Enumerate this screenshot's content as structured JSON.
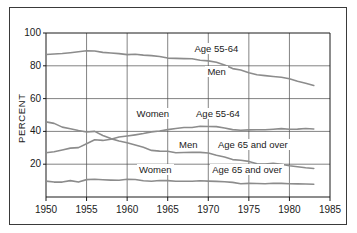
{
  "figure": {
    "background": "#ffffff",
    "frame_color": "#3a3a3a",
    "axis_color": "#1a1a1a",
    "grid_color": "#4d4d4d",
    "line_color": "#8c8c8c"
  },
  "axis": {
    "ylabel": "PERCENT",
    "yticks": [
      "20",
      "40",
      "60",
      "80",
      "100"
    ],
    "xticks": [
      "1950",
      "1955",
      "1960",
      "1965",
      "1970",
      "1975",
      "1980",
      "1985"
    ]
  },
  "annotations": [
    {
      "text": "Age 55-64",
      "name": "annotation-men-55-64-group"
    },
    {
      "text": "Men",
      "name": "annotation-men-55-64"
    },
    {
      "text": "Women",
      "name": "annotation-women-55-64"
    },
    {
      "text": "Age 55-64",
      "name": "annotation-women-55-64-group"
    },
    {
      "text": "Men",
      "name": "annotation-men-65-plus"
    },
    {
      "text": "Age 65 and over",
      "name": "annotation-men-65-plus-group"
    },
    {
      "text": "Women",
      "name": "annotation-women-65-plus"
    },
    {
      "text": "Age 65 and over",
      "name": "annotation-women-65-plus-group"
    }
  ],
  "chart_data": {
    "type": "line",
    "title": "",
    "xlabel": "",
    "ylabel": "PERCENT",
    "xlim": [
      1950,
      1985
    ],
    "ylim": [
      0,
      100
    ],
    "grid": true,
    "legend_position": "inline-annotations",
    "xticks": [
      1950,
      1955,
      1960,
      1965,
      1970,
      1975,
      1980,
      1985
    ],
    "yticks": [
      20,
      40,
      60,
      80,
      100
    ],
    "x": [
      1950,
      1951,
      1952,
      1953,
      1954,
      1955,
      1956,
      1957,
      1958,
      1959,
      1960,
      1961,
      1962,
      1963,
      1964,
      1965,
      1966,
      1967,
      1968,
      1969,
      1970,
      1971,
      1972,
      1973,
      1974,
      1975,
      1976,
      1977,
      1978,
      1979,
      1980,
      1981,
      1982,
      1983
    ],
    "series": [
      {
        "name": "Men Age 55-64",
        "label": "Men",
        "group": "Age 55-64",
        "values": [
          86.9,
          87.2,
          87.5,
          88.0,
          88.6,
          89.2,
          89.0,
          88.2,
          87.8,
          87.4,
          86.8,
          87.0,
          86.5,
          86.2,
          85.7,
          84.7,
          84.5,
          84.4,
          84.3,
          83.4,
          83.0,
          82.2,
          80.5,
          78.3,
          77.4,
          75.8,
          74.5,
          74.0,
          73.5,
          73.0,
          72.1,
          70.6,
          69.4,
          68.0
        ]
      },
      {
        "name": "Women Age 55-64",
        "label": "Women",
        "group": "Age 55-64",
        "values": [
          27.0,
          27.6,
          28.7,
          29.8,
          30.1,
          32.5,
          34.9,
          34.5,
          35.2,
          36.6,
          37.2,
          37.9,
          38.7,
          39.7,
          40.2,
          41.1,
          41.8,
          42.4,
          42.4,
          43.1,
          43.0,
          42.9,
          42.1,
          41.1,
          40.7,
          40.9,
          41.0,
          41.0,
          41.3,
          41.7,
          41.3,
          41.4,
          41.8,
          41.5
        ]
      },
      {
        "name": "Men Age 65 and over",
        "label": "Men",
        "group": "Age 65 and over",
        "values": [
          45.8,
          44.9,
          42.6,
          41.6,
          40.5,
          39.6,
          40.0,
          37.5,
          35.6,
          34.2,
          33.1,
          31.7,
          30.3,
          28.4,
          28.0,
          27.9,
          27.0,
          27.1,
          27.3,
          27.2,
          26.8,
          25.5,
          24.4,
          22.8,
          22.4,
          21.7,
          20.3,
          20.1,
          20.5,
          20.0,
          19.1,
          18.4,
          17.8,
          17.4
        ]
      },
      {
        "name": "Women Age 65 and over",
        "label": "Women",
        "group": "Age 65 and over",
        "values": [
          9.7,
          9.1,
          9.1,
          10.0,
          9.1,
          10.6,
          10.8,
          10.5,
          10.3,
          10.2,
          10.8,
          10.7,
          9.9,
          9.6,
          10.1,
          10.0,
          9.6,
          9.6,
          9.6,
          9.9,
          9.7,
          9.5,
          9.3,
          8.9,
          8.1,
          8.3,
          8.2,
          8.1,
          8.4,
          8.3,
          8.1,
          8.0,
          7.9,
          7.8
        ]
      }
    ]
  }
}
